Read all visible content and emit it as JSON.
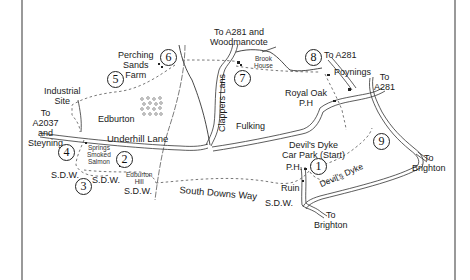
{
  "map": {
    "title": "Devil's Dyke circular walk",
    "frame_color": "#555555",
    "line_color": "#222222",
    "path_color": "#666666"
  },
  "waypoints": [
    {
      "n": "1",
      "label": "1"
    },
    {
      "n": "2",
      "label": "2"
    },
    {
      "n": "3",
      "label": "3"
    },
    {
      "n": "4",
      "label": "4"
    },
    {
      "n": "5",
      "label": "5"
    },
    {
      "n": "6",
      "label": "6"
    },
    {
      "n": "7",
      "label": "7"
    },
    {
      "n": "8",
      "label": "8"
    },
    {
      "n": "9",
      "label": "9"
    }
  ],
  "labels": {
    "to_a281_woodmancote_1": "To A281 and",
    "to_a281_woodmancote_2": "Woodmancote",
    "perching_1": "Perching",
    "perching_2": "Sands",
    "perching_3": "Farm",
    "brook_1": "Brook",
    "brook_2": "House",
    "to_a281_a": "To A281",
    "poynings": "Poynings",
    "to_a281_b_1": "To",
    "to_a281_b_2": "A281",
    "industrial_1": "Industrial",
    "industrial_2": "Site",
    "to_a2037_1": "To",
    "to_a2037_2": "A2037",
    "to_a2037_3": "and",
    "to_a2037_4": "Steyning",
    "edburton": "Edburton",
    "clappers_lane": "Clappers Lans",
    "royal_oak_1": "Royal Oak",
    "royal_oak_2": "P.H",
    "underhill_lane": "Underhill Lane",
    "fulking": "Fulking",
    "devils_dyke_cp_1": "Devil's Dyke",
    "devils_dyke_cp_2": "Car Park (Start)",
    "springs_1": "Springs",
    "springs_2": "Smoked",
    "springs_3": "Salmon",
    "edburton_hill_1": "Edburton",
    "edburton_hill_2": "Hill",
    "sdw_1": "S.D.W.",
    "sdw_2": "S.D.W.",
    "sdw_3": "S.D.W.",
    "sdw_4": "S.D.W.",
    "south_downs_way": "South Downs Way",
    "ph": "P.H.",
    "ruin": "Ruin",
    "devils_dyke_path": "Devil's Dyke",
    "to_brighton_a_1": "To",
    "to_brighton_a_2": "Brighton",
    "to_brighton_b_1": "To",
    "to_brighton_b_2": "Brighton"
  }
}
